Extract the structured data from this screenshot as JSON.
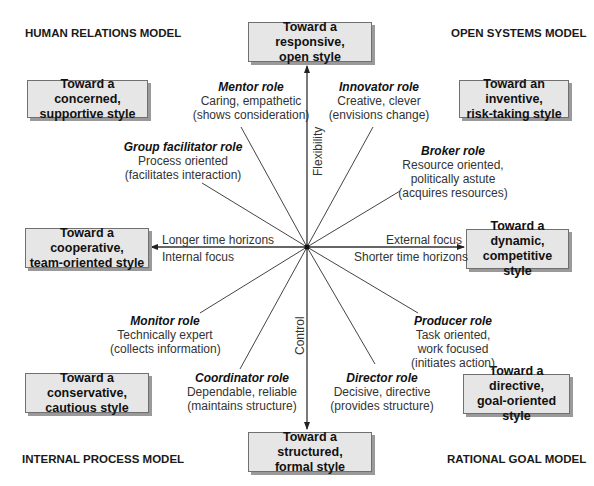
{
  "models": {
    "top_left": "HUMAN RELATIONS MODEL",
    "top_right": "OPEN SYSTEMS MODEL",
    "bottom_left": "INTERNAL PROCESS MODEL",
    "bottom_right": "RATIONAL GOAL MODEL"
  },
  "boxes": {
    "top": {
      "line1": "Toward a responsive,",
      "line2": "open style"
    },
    "bottom": {
      "line1": "Toward a structured,",
      "line2": "formal style"
    },
    "left": {
      "line1": "Toward a cooperative,",
      "line2": "team-oriented style"
    },
    "right": {
      "line1": "Toward a dynamic,",
      "line2": "competitive style"
    },
    "top_left": {
      "line1": "Toward a concerned,",
      "line2": "supportive style"
    },
    "top_right": {
      "line1": "Toward an inventive,",
      "line2": "risk-taking style"
    },
    "bottom_left": {
      "line1": "Toward a conservative,",
      "line2": "cautious style"
    },
    "bottom_right": {
      "line1": "Toward a directive,",
      "line2": "goal-oriented style"
    }
  },
  "roles": {
    "mentor": {
      "title": "Mentor role",
      "line1": "Caring, empathetic",
      "line2": "(shows consideration)"
    },
    "innovator": {
      "title": "Innovator role",
      "line1": "Creative, clever",
      "line2": "(envisions change)"
    },
    "group_facilitator": {
      "title": "Group facilitator role",
      "line1": "Process oriented",
      "line2": "(facilitates interaction)"
    },
    "broker": {
      "title": "Broker role",
      "line1": "Resource oriented,",
      "line2": "politically astute",
      "line3": "(acquires resources)"
    },
    "monitor": {
      "title": "Monitor role",
      "line1": "Technically expert",
      "line2": "(collects information)"
    },
    "producer": {
      "title": "Producer role",
      "line1": "Task oriented,",
      "line2": "work focused",
      "line3": "(initiates action)"
    },
    "coordinator": {
      "title": "Coordinator role",
      "line1": "Dependable, reliable",
      "line2": "(maintains structure)"
    },
    "director": {
      "title": "Director role",
      "line1": "Decisive, directive",
      "line2": "(provides structure)"
    }
  },
  "axes": {
    "vertical_top": "Flexibility",
    "vertical_bottom": "Control",
    "left_upper": "Longer time horizons",
    "left_lower": "Internal focus",
    "right_upper": "External focus",
    "right_lower": "Shorter time horizons"
  },
  "colors": {
    "box_fill": "#e6e6e6",
    "box_border": "#707070",
    "box_shadow": "#9a9a9a",
    "line": "#333333"
  }
}
